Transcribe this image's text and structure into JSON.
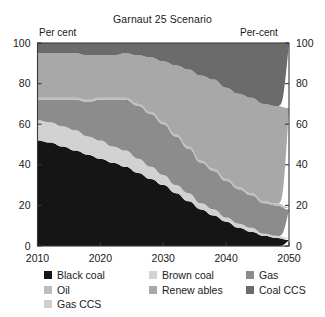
{
  "chart_data": {
    "type": "area",
    "stacked": true,
    "title": "Garnaut 25 Scenario",
    "xlabel": "",
    "ylabel": "Per cent",
    "ylabel_right": "Per-cent",
    "unit_left": "Per cent",
    "unit_right": "Per-cent",
    "xlim": [
      2010,
      2050
    ],
    "ylim": [
      0,
      100
    ],
    "grid": false,
    "legend_position": "bottom",
    "x": [
      2010,
      2012,
      2014,
      2016,
      2018,
      2020,
      2022,
      2024,
      2026,
      2028,
      2030,
      2032,
      2034,
      2036,
      2038,
      2040,
      2042,
      2044,
      2046,
      2048,
      2050
    ],
    "xticks": [
      2010,
      2020,
      2030,
      2040,
      2050
    ],
    "yticks": [
      0,
      20,
      40,
      60,
      80,
      100
    ],
    "xtick_labels": [
      "2010",
      "2020",
      "2030",
      "2040",
      "2050"
    ],
    "ytick_labels": [
      "0",
      "20",
      "40",
      "60",
      "80",
      "100"
    ],
    "series": [
      {
        "name": "Black coal",
        "color": "#151515",
        "values": [
          52,
          51,
          49,
          47,
          45,
          43,
          41,
          39,
          36,
          33,
          30,
          26,
          22,
          18,
          15,
          12,
          9,
          7,
          5,
          4,
          3
        ]
      },
      {
        "name": "Brown coal",
        "color": "#d2d2d2",
        "values": [
          10,
          10,
          10,
          10,
          9,
          9,
          8,
          8,
          7,
          6,
          5,
          4,
          4,
          3,
          3,
          2,
          2,
          2,
          1,
          1,
          1
        ]
      },
      {
        "name": "Gas",
        "color": "#8c8c8c",
        "values": [
          10,
          11,
          13,
          15,
          17,
          20,
          23,
          25,
          26,
          26,
          25,
          24,
          22,
          20,
          19,
          18,
          17,
          16,
          15,
          15,
          14
        ]
      },
      {
        "name": "Oil",
        "color": "#bdbdbd",
        "values": [
          1,
          1,
          1,
          1,
          1,
          1,
          1,
          1,
          1,
          1,
          1,
          1,
          1,
          1,
          1,
          1,
          1,
          1,
          1,
          1,
          1
        ]
      },
      {
        "name": "Renew ables",
        "color": "#a8a8a8",
        "values": [
          22,
          22,
          22,
          22,
          22,
          21,
          21,
          22,
          24,
          27,
          30,
          34,
          38,
          42,
          44,
          45,
          46,
          47,
          48,
          48,
          49
        ]
      },
      {
        "name": "Coal CCS",
        "color": "#6b6b6b",
        "values": [
          5,
          5,
          5,
          5,
          6,
          6,
          6,
          5,
          6,
          7,
          9,
          11,
          13,
          16,
          18,
          22,
          25,
          27,
          30,
          31,
          32
        ]
      },
      {
        "name": "Gas CCS",
        "color": "#cfcfcf",
        "values": [
          0,
          0,
          0,
          0,
          0,
          0,
          0,
          0,
          0,
          0,
          0,
          0,
          0,
          0,
          0,
          0,
          0,
          0,
          0,
          0,
          0
        ]
      }
    ]
  },
  "legend": {
    "rows": [
      [
        {
          "label": "Black coal",
          "color": "#151515"
        },
        {
          "label": "Brown coal",
          "color": "#d2d2d2"
        },
        {
          "label": "Gas",
          "color": "#8c8c8c"
        }
      ],
      [
        {
          "label": "Oil",
          "color": "#bdbdbd"
        },
        {
          "label": "Renew ables",
          "color": "#a8a8a8"
        },
        {
          "label": "Coal CCS",
          "color": "#6b6b6b"
        }
      ],
      [
        {
          "label": "Gas CCS",
          "color": "#cfcfcf"
        }
      ]
    ]
  }
}
